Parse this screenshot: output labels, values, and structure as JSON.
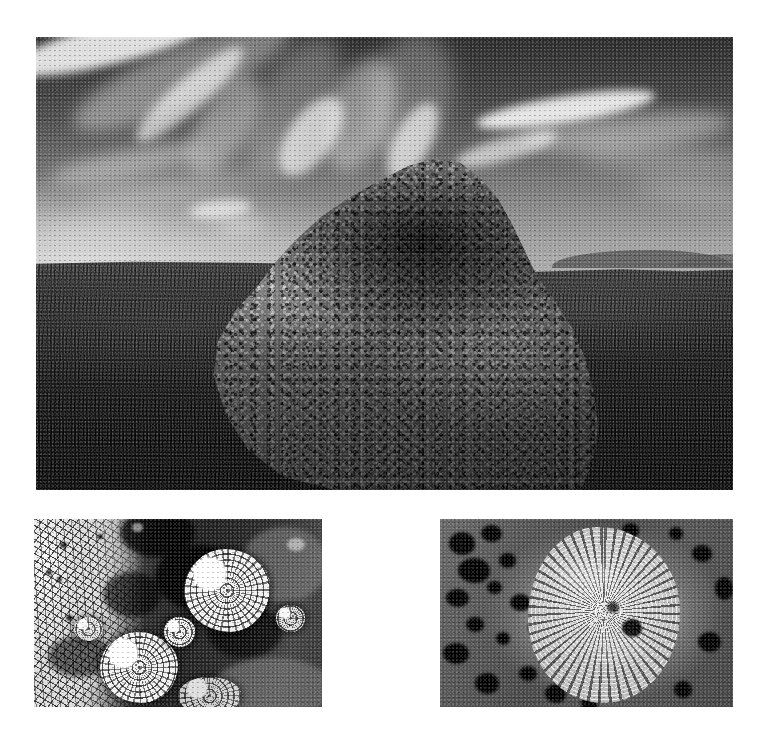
{
  "figure": {
    "kind": "photographic-plate",
    "background_color": "#ffffff",
    "canvas": {
      "width": 766,
      "height": 733
    },
    "rendering": "black-and-white photograph",
    "panel_count": 3
  },
  "panels": [
    {
      "id": "panel-a",
      "name": "landscape-boulder-photo",
      "position": {
        "x": 36,
        "y": 37,
        "width": 697,
        "height": 453
      },
      "subject": "lichen-covered boulder outcrop in open grassland",
      "scene": {
        "sky": {
          "description": "clear sky with wispy cirrus cloud streaks radiating from upper left",
          "tone_top": "#343434",
          "tone_horizon": "#a6a6a6",
          "cloud_tone": "#ffffff"
        },
        "horizon": {
          "description": "low flat grassland horizon with distant hills to the right",
          "relative_y": 0.5
        },
        "ground": {
          "description": "dark tussock grass and low shrub prairie",
          "tone_near": "#191919",
          "tone_far": "#4a4a4a"
        },
        "boulder": {
          "description": "large rounded granite boulder encrusted with lichen, occupying the centre of the frame",
          "highlight_tone": "#9a9a9a",
          "shadow_tone": "#2c2c2c"
        }
      }
    },
    {
      "id": "panel-b",
      "name": "lichen-macro-left",
      "position": {
        "x": 34,
        "y": 519,
        "width": 288,
        "height": 188
      },
      "subject": "macro view of lichen community on rock surface",
      "features": [
        "pale cracked (areolate) crustose lichen covering the left third",
        "dark bare rock and dark crustose lichen through the middle",
        "bright white foliose lichen rosettes at upper right and lower centre",
        "small dark apothecia dots scattered across the pale crust"
      ],
      "tones": {
        "light": "#e4e4e4",
        "mid": "#8a8a8a",
        "dark": "#2a2a2a"
      }
    },
    {
      "id": "panel-c",
      "name": "lichen-macro-right",
      "position": {
        "x": 440,
        "y": 519,
        "width": 293,
        "height": 188
      },
      "subject": "macro view of a single rosette-forming lichen colony",
      "features": [
        "central pale rosette colony with radiating lobed margin",
        "granular textured thallus surface",
        "dark pits and hollows in the surrounding rock",
        "one deep dark cavity near the colony centre-right"
      ],
      "tones": {
        "light": "#c0c0c0",
        "mid": "#5a5a5a",
        "dark": "#0a0a0a"
      }
    }
  ],
  "text_elements": {
    "captions": [],
    "labels": [],
    "note": "no visible text, captions, axis labels or legends in this image"
  }
}
